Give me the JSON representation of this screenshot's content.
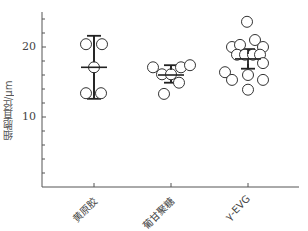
{
  "chart_data": {
    "type": "scatter",
    "subtype": "dot-plot with mean and error bars",
    "title": "",
    "xlabel": "",
    "ylabel": "细胞直径/μm",
    "ylim": [
      0,
      25
    ],
    "yticks_major": [
      10,
      20
    ],
    "yticks_minor_step": 2,
    "grid": false,
    "legend": null,
    "categories": [
      "黄原胶",
      "葡甘聚糖",
      "γ-EVG"
    ],
    "series": [
      {
        "name": "黄原胶",
        "points": [
          20.4,
          20.4,
          17.1,
          13.4,
          13.4
        ],
        "mean": 17.1,
        "error_low": 12.6,
        "error_high": 21.6
      },
      {
        "name": "葡甘聚糖",
        "points": [
          17.1,
          16.1,
          16.1,
          17.1,
          17.4,
          14.9,
          13.3
        ],
        "mean": 16.0,
        "error_low": 14.9,
        "error_high": 17.4
      },
      {
        "name": "γ-EVG",
        "points": [
          23.6,
          20.0,
          20.3,
          21.0,
          20.0,
          18.9,
          18.9,
          18.9,
          18.9,
          17.7,
          16.4,
          15.3,
          16.0,
          15.3,
          13.9
        ],
        "mean": 18.3,
        "error_low": 16.9,
        "error_high": 19.7
      }
    ]
  },
  "axis": {
    "y_label": "细胞直径/μm",
    "y_tick_labels": [
      "20",
      "10"
    ],
    "x_tick_labels": [
      "黄原胶",
      "葡甘聚糖",
      "γ-EVG"
    ]
  },
  "colors": {
    "axis": "#555555",
    "marker_stroke": "#333333",
    "marker_fill": "#ffffff",
    "errorbar": "#222222"
  }
}
